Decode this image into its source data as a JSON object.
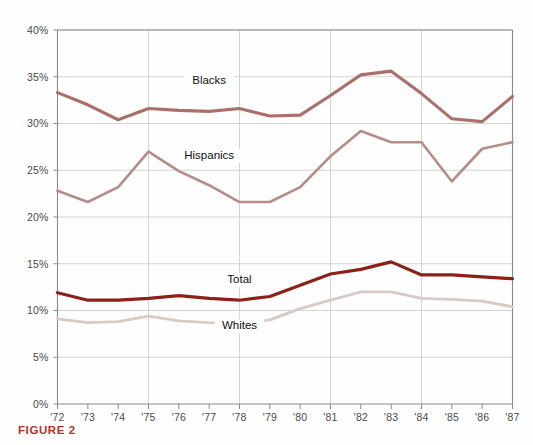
{
  "caption": "FIGURE 2",
  "caption_color": "#b3342c",
  "chart_data": {
    "type": "line",
    "title": "",
    "subtitle": "",
    "xlabel": "",
    "ylabel": "",
    "x": [
      "'72",
      "'73",
      "'74",
      "'75",
      "'76",
      "'77",
      "'78",
      "'79",
      "'80",
      "'81",
      "'82",
      "'83",
      "'84",
      "'85",
      "'86",
      "'87"
    ],
    "xtick_labels": [
      "'72",
      "'73",
      "'74",
      "'75",
      "'76",
      "'77",
      "'78",
      "'79",
      "'80",
      "'81",
      "'82",
      "'83",
      "'84",
      "'85",
      "'86",
      "'87"
    ],
    "ytick_labels": [
      "0%",
      "5%",
      "10%",
      "15%",
      "20%",
      "25%",
      "30%",
      "35%",
      "40%"
    ],
    "ytick_values": [
      0,
      5,
      10,
      15,
      20,
      25,
      30,
      35,
      40
    ],
    "ylim": [
      0,
      40
    ],
    "grid": true,
    "legend_position": "inline-annotations",
    "series": [
      {
        "name": "Blacks",
        "color": "#a9706b",
        "width": 3.1,
        "label_x": "'77",
        "label_y": 34.2,
        "values": [
          33.3,
          32.0,
          30.4,
          31.6,
          31.4,
          31.3,
          31.6,
          30.8,
          30.9,
          33.0,
          35.2,
          35.6,
          33.2,
          30.5,
          30.2,
          32.9
        ]
      },
      {
        "name": "Hispanics",
        "color": "#b48d88",
        "width": 2.6,
        "label_x": "'77",
        "label_y": 26.2,
        "values": [
          22.8,
          21.6,
          23.2,
          27.0,
          24.9,
          23.4,
          21.6,
          21.6,
          23.2,
          26.5,
          29.2,
          28.0,
          28.0,
          23.8,
          27.3,
          28.0
        ]
      },
      {
        "name": "Total",
        "color": "#8b2119",
        "width": 3.2,
        "label_x": "'78",
        "label_y": 12.9,
        "values": [
          11.9,
          11.1,
          11.1,
          11.3,
          11.6,
          11.3,
          11.1,
          11.5,
          12.7,
          13.9,
          14.4,
          15.2,
          13.8,
          13.8,
          13.6,
          13.4
        ]
      },
      {
        "name": "Whites",
        "color": "#d8cac6",
        "width": 2.8,
        "label_x": "'78",
        "label_y": 8.0,
        "values": [
          9.1,
          8.7,
          8.8,
          9.4,
          8.9,
          8.7,
          8.6,
          9.0,
          10.2,
          11.1,
          12.0,
          12.0,
          11.3,
          11.2,
          11.0,
          10.4
        ]
      }
    ]
  }
}
